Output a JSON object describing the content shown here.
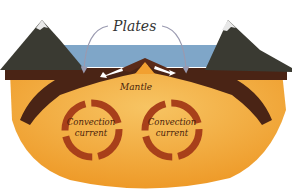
{
  "diagram": {
    "labels": {
      "plates": "Plates",
      "mantle": "Mantle",
      "convection_left_line1": "Convection",
      "convection_left_line2": "current",
      "convection_right_line1": "Convection",
      "convection_right_line2": "current"
    },
    "elements": [
      "mountain-left",
      "mountain-right",
      "ocean",
      "crust-plates",
      "ridge",
      "mantle",
      "convection-loop-left",
      "convection-loop-right"
    ],
    "colors": {
      "ocean": "#7fa6c8",
      "crust": "#4a2415",
      "mantle": "#f0a030",
      "mantle_light": "#f6c060",
      "convection_arrow": "#a8401a",
      "mountain": "#3a3a32",
      "snow": "#e8e8e8",
      "pointer_arrow": "#9a9ab0"
    }
  }
}
